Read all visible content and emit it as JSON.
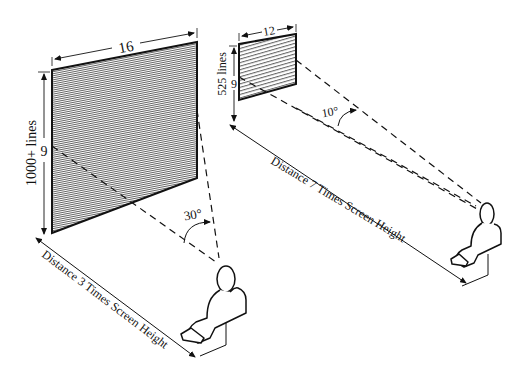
{
  "diagram": {
    "left": {
      "screen_width_label": "16",
      "screen_height_label": "9",
      "lines_label": "1000+ lines",
      "angle_label": "30°",
      "distance_label": "Distance 3 Times Screen Height"
    },
    "right": {
      "screen_width_label": "12",
      "screen_height_label": "9",
      "lines_label": "525 lines",
      "angle_label": "10°",
      "distance_label": "Distance 7 Times Screen Height"
    },
    "colors": {
      "ink": "#111111",
      "background": "#ffffff"
    }
  }
}
